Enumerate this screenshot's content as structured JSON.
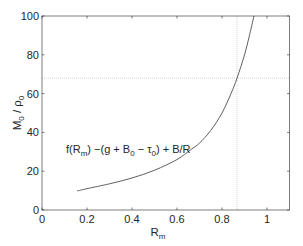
{
  "chart_data": {
    "type": "line",
    "title": "",
    "xlabel": "R_m",
    "ylabel": "M_0 / ρ_0",
    "xlim": [
      0,
      1.1
    ],
    "ylim": [
      0,
      100
    ],
    "xticks": [
      0,
      0.2,
      0.4,
      0.6,
      0.8,
      1
    ],
    "xtick_labels": [
      "0",
      "0.2",
      "0.4",
      "0.6",
      "0.8",
      "1"
    ],
    "yticks": [
      0,
      20,
      40,
      60,
      80,
      100
    ],
    "ytick_labels": [
      "0",
      "20",
      "40",
      "60",
      "80",
      "100"
    ],
    "grid": false,
    "series": [
      {
        "name": "f(R_m) −(g + B_0 − τ_0) + B/R",
        "color": "#4d4d4d",
        "x": [
          0.156,
          0.2,
          0.3,
          0.4,
          0.5,
          0.6,
          0.66,
          0.7,
          0.75,
          0.8,
          0.84,
          0.867,
          0.9,
          0.92,
          0.942
        ],
        "y": [
          9.8,
          11.0,
          13.5,
          16.5,
          20.5,
          26.0,
          31.0,
          34.5,
          41.0,
          50.0,
          60.0,
          68.0,
          80.0,
          89.0,
          100.0
        ]
      }
    ],
    "reference_lines": [
      {
        "orientation": "vertical",
        "x": 0.867,
        "style": "dotted",
        "color": "#c8c8c8"
      },
      {
        "orientation": "horizontal",
        "y": 68,
        "style": "dotted",
        "color": "#c8c8c8"
      }
    ],
    "annotations": [
      {
        "text": "f(R_m) −(g + B_0 − τ_0) + B/R",
        "x": 0.11,
        "y": 30
      }
    ]
  },
  "labels": {
    "xlabel_main": "R",
    "xlabel_sub": "m",
    "ylabel_m": "M",
    "ylabel_m_sub": "0",
    "ylabel_sep": " / ",
    "ylabel_rho": "ρ",
    "ylabel_rho_sub": "0",
    "annot_parts": [
      "f(R",
      "m",
      ") −(g + B",
      "0",
      " − τ",
      "0",
      ") + B/R"
    ]
  }
}
